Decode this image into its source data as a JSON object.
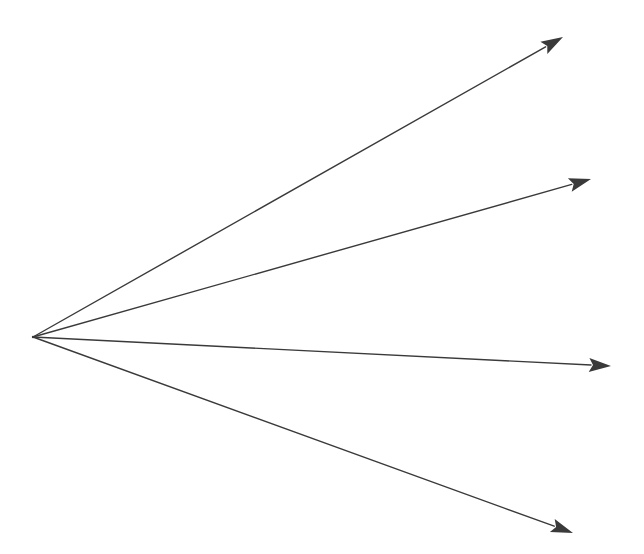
{
  "diagram": {
    "width": 644,
    "height": 554,
    "background": "#ffffff",
    "stroke_color": "#3a3a3a",
    "stroke_width": 1.4,
    "origin": {
      "x": 33,
      "y": 337
    },
    "arrows": [
      {
        "id": "arrow-1",
        "to": {
          "x": 563,
          "y": 37
        }
      },
      {
        "id": "arrow-2",
        "to": {
          "x": 591,
          "y": 179
        }
      },
      {
        "id": "arrow-3",
        "to": {
          "x": 611,
          "y": 366
        }
      },
      {
        "id": "arrow-4",
        "to": {
          "x": 573,
          "y": 533
        }
      }
    ],
    "arrowhead": {
      "length": 22,
      "half_width": 7
    }
  }
}
